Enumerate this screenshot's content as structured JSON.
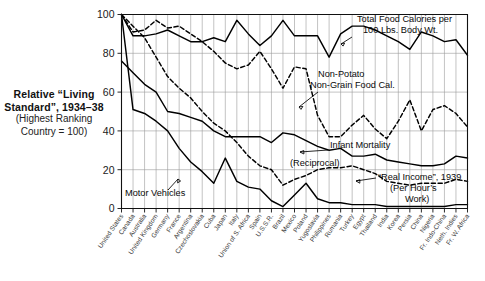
{
  "title": {
    "line1": "Relative “Living",
    "line2": "Standard”, 1934–38",
    "line3": "(Highest Ranking",
    "line4": "Country = 100)"
  },
  "axes": {
    "y_ticks": [
      "0",
      "20",
      "40",
      "60",
      "80",
      "100"
    ],
    "y_min": 0,
    "y_max": 100
  },
  "annotations": {
    "total_food": {
      "line1": "Total Food Calories per",
      "line2": "100 Lbs. Body Wt."
    },
    "non_potato": {
      "line1": "Non-Potato",
      "line2": "Non-Grain Food Cal."
    },
    "infant_mortality": {
      "line1": "Infant Mortality",
      "line2": "(Reciprocal)"
    },
    "real_income": {
      "line1": "“Real Income”, 1939",
      "line2": "(Per Hour’s",
      "line3": "Work)"
    },
    "motor_vehicles": {
      "line1": "Motor Vehicles"
    }
  },
  "chart_data": {
    "type": "line",
    "title": "Relative “Living Standard”, 1934–38 (Highest Ranking Country = 100)",
    "xlabel": "",
    "ylabel": "",
    "ylim": [
      0,
      100
    ],
    "grid": true,
    "legend_position": "inline-annotations",
    "categories": [
      "United States",
      "Canada",
      "Australia",
      "United Kingdom",
      "Germany",
      "France",
      "Argentina",
      "Czechoslovakia",
      "Cuba",
      "Japan",
      "Italy",
      "Union of S. Africa",
      "Spain",
      "U.S.S.R.",
      "Brazil",
      "Mexico",
      "Poland",
      "Yugoslavia",
      "Philippines",
      "Rumania",
      "Turkey",
      "Egypt",
      "Thailand",
      "India",
      "Korea",
      "Persia",
      "China",
      "Nigeria",
      "Fr. Indo-China",
      "Neth. Indies",
      "Fr. W. Africa"
    ],
    "series": [
      {
        "name": "Total Food Calories per 100 Lbs. Body Wt.",
        "style": "solid",
        "values": [
          100,
          89,
          89,
          90,
          92,
          89,
          86,
          86,
          88,
          86,
          97,
          90,
          84,
          89,
          97,
          89,
          89,
          89,
          78,
          90,
          94,
          94,
          92,
          89,
          86,
          82,
          91,
          89,
          86,
          87,
          79
        ]
      },
      {
        "name": "Non-Potato Non-Grain Food Cal.",
        "style": "dashed",
        "values": [
          100,
          91,
          92,
          97,
          93,
          94,
          90,
          86,
          81,
          75,
          72,
          74,
          81,
          72,
          62,
          73,
          72,
          48,
          37,
          37,
          43,
          48,
          41,
          36,
          45,
          56,
          40,
          51,
          53,
          49,
          42
        ]
      },
      {
        "name": "Infant Mortality (Reciprocal)",
        "style": "solid",
        "values": [
          76,
          70,
          64,
          60,
          50,
          49,
          47,
          45,
          40,
          37,
          37,
          37,
          37,
          34,
          39,
          38,
          35,
          32,
          30,
          31,
          27,
          27,
          28,
          25,
          24,
          23,
          22,
          22,
          23,
          27,
          26
        ]
      },
      {
        "name": "“Real Income”, 1939 (Per Hour’s Work)",
        "style": "dashed",
        "values": [
          100,
          94,
          88,
          78,
          68,
          62,
          57,
          50,
          44,
          40,
          34,
          27,
          22,
          20,
          12,
          15,
          17,
          20,
          21,
          21,
          22,
          20,
          18,
          14,
          13,
          12,
          13,
          13,
          13,
          15,
          14
        ]
      },
      {
        "name": "Motor Vehicles",
        "style": "solid",
        "values": [
          100,
          51,
          49,
          45,
          40,
          31,
          24,
          19,
          13,
          26,
          14,
          11,
          10,
          4,
          1,
          7,
          13,
          5,
          3,
          3,
          2,
          2,
          2,
          1,
          1,
          1,
          1,
          1,
          1,
          2,
          2
        ]
      }
    ]
  }
}
